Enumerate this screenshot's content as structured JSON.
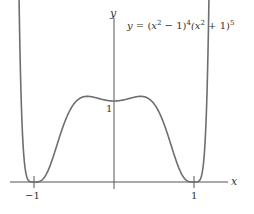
{
  "chart_data": {
    "type": "line",
    "title": "",
    "equation": {
      "lhs": "y",
      "rhs_parts": [
        "(x",
        "2",
        " − 1)",
        "4",
        "(x",
        "2",
        " + 1)",
        "5"
      ]
    },
    "xlabel": "x",
    "ylabel": "y",
    "x_ticks": [
      {
        "value": -1,
        "label": "−1"
      },
      {
        "value": 1,
        "label": "1"
      }
    ],
    "y_ticks": [
      {
        "value": 1,
        "label": "1"
      }
    ],
    "xlim": [
      -1.42,
      1.72
    ],
    "ylim": [
      -0.2,
      2.0
    ],
    "grid": false,
    "legend": null,
    "series": [
      {
        "name": "y = (x^2 - 1)^4 (x^2 + 1)^5",
        "color": "#6e6e6e",
        "function": "(x^2-1)^4*(x^2+1)^5",
        "x_range": [
          -1.27,
          1.27
        ],
        "x": [
          -1.27,
          -1.2,
          -1.1,
          -1.0,
          -0.9,
          -0.8,
          -0.7,
          -0.6,
          -0.5,
          -0.45,
          -0.3,
          -0.15,
          0,
          0.15,
          0.3,
          0.45,
          0.5,
          0.6,
          0.7,
          0.8,
          0.9,
          1.0,
          1.1,
          1.2,
          1.27
        ],
        "values": [
          1.85,
          0.62,
          0.03,
          0.0,
          0.02,
          0.19,
          0.53,
          0.87,
          1.06,
          1.08,
          1.04,
          1.01,
          1.0,
          1.01,
          1.04,
          1.08,
          1.06,
          0.87,
          0.53,
          0.19,
          0.02,
          0.0,
          0.03,
          0.62,
          1.85
        ]
      }
    ]
  },
  "labels": {
    "x_axis": "x",
    "y_axis": "y",
    "tick_neg1": "−1",
    "tick_pos1": "1",
    "tick_y1": "1",
    "eq_y": "y",
    "eq_eq": " = (",
    "eq_x1": "x",
    "eq_sup1": "2",
    "eq_m1": " − 1)",
    "eq_sup2": "4",
    "eq_x2": "(x",
    "eq_sup3": "2",
    "eq_p1": " + 1)",
    "eq_sup4": "5"
  }
}
